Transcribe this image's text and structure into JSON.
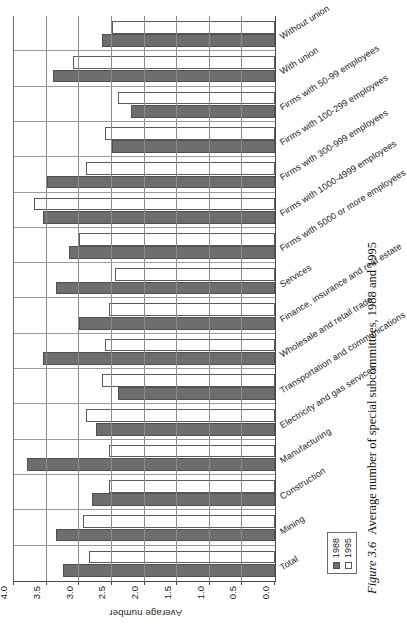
{
  "figure": {
    "number_label": "Figure 3.6",
    "caption_text": "Average number of special subcommittees, 1988 and 1995"
  },
  "legend": {
    "position": "inside-bottom-left",
    "entries": [
      {
        "label": "1988",
        "color": "#6e6e6e",
        "swatch": "filled-square"
      },
      {
        "label": "1995",
        "color": "#ffffff",
        "swatch": "empty-square"
      }
    ]
  },
  "chart_data": {
    "type": "bar",
    "title": "",
    "subtitle": "",
    "xlabel": "",
    "ylabel": "Average number",
    "ylim": [
      0.0,
      4.0
    ],
    "ytick_labels": [
      "0.0",
      "0.5",
      "1.0",
      "1.5",
      "2.0",
      "2.5",
      "3.0",
      "3.5",
      "4.0"
    ],
    "ytick_values": [
      0.0,
      0.5,
      1.0,
      1.5,
      2.0,
      2.5,
      3.0,
      3.5,
      4.0
    ],
    "grid": true,
    "legend_position": "inside bottom left",
    "orientation": "vertical-bars-rotated-90ccw",
    "categories": [
      "Total",
      "Mining",
      "Construction",
      "Manufacturing",
      "Electricity and gas services",
      "Transportation and communications",
      "Wholesale and retail trade",
      "Finance, insurance and real estate",
      "Services",
      "Firms with 5000 or more employees",
      "Firms with 1000-4999 employees",
      "Firms with 300-999 employees",
      "Firms with 100-299 employees",
      "Firms with 50-99 employees",
      "With union",
      "Without union"
    ],
    "series": [
      {
        "name": "1988",
        "color": "#6e6e6e",
        "values": [
          3.25,
          3.35,
          2.8,
          3.8,
          2.75,
          2.4,
          3.55,
          3.0,
          3.35,
          3.15,
          3.55,
          3.5,
          2.5,
          2.2,
          3.4,
          2.65
        ]
      },
      {
        "name": "1995",
        "color": "#ffffff",
        "values": [
          2.85,
          2.95,
          2.55,
          2.55,
          2.9,
          2.65,
          2.6,
          2.55,
          2.45,
          3.0,
          3.7,
          2.9,
          2.6,
          2.4,
          3.1,
          2.5
        ]
      }
    ]
  }
}
